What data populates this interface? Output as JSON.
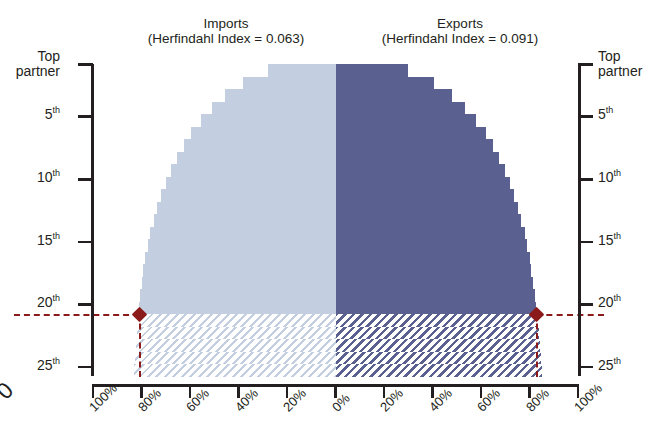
{
  "chart_data": {
    "type": "bar",
    "subtitle": "",
    "orientation": "horizontal-diverging",
    "xlabel": "",
    "ylabel": "",
    "grid": false,
    "legend_position": "top",
    "xlim": [
      -100,
      100
    ],
    "x_tick_labels": [
      "100%",
      "80%",
      "60%",
      "40%",
      "20%",
      "0%",
      "20%",
      "40%",
      "60%",
      "80%",
      "100%"
    ],
    "x_tick_values": [
      -100,
      -80,
      -60,
      -40,
      -20,
      0,
      20,
      40,
      60,
      80,
      100
    ],
    "y_tick_labels": [
      "Top partner",
      "5th",
      "10th",
      "15th",
      "20th",
      "25th"
    ],
    "y_tick_values": [
      1,
      5,
      10,
      15,
      20,
      25
    ],
    "categories": [
      "1",
      "2",
      "3",
      "4",
      "5",
      "6",
      "7",
      "8",
      "9",
      "10",
      "11",
      "12",
      "13",
      "14",
      "15",
      "16",
      "17",
      "18",
      "19",
      "20",
      "21",
      "22",
      "23",
      "24",
      "25"
    ],
    "series": [
      {
        "name": "Imports",
        "side": "left",
        "color": "#c3cfe0",
        "herfindahl_index": 0.063,
        "values": [
          28.0,
          38.0,
          45.5,
          51.0,
          55.5,
          59.5,
          62.5,
          65.5,
          68.0,
          70.0,
          72.0,
          73.5,
          75.0,
          76.5,
          77.5,
          78.5,
          79.2,
          80.0,
          80.6,
          81.0,
          81.5,
          82.0,
          82.4,
          82.8,
          83.0
        ]
      },
      {
        "name": "Exports",
        "side": "right",
        "color": "#5a6090",
        "herfindahl_index": 0.091,
        "values": [
          30.0,
          40.5,
          48.0,
          53.5,
          58.0,
          62.0,
          65.0,
          67.5,
          70.0,
          72.0,
          73.8,
          75.3,
          76.7,
          78.0,
          79.0,
          80.0,
          80.8,
          81.5,
          82.2,
          82.8,
          83.3,
          83.8,
          84.2,
          84.6,
          85.0
        ]
      }
    ],
    "hatched_from_rank": 21,
    "annotations": [
      {
        "name": "top-20-reference",
        "rank": 20,
        "imports_share": 81.0,
        "exports_share": 82.8,
        "style": "dashed",
        "color": "#8b1a1a",
        "marker": "diamond"
      }
    ]
  },
  "titles": {
    "imports": {
      "main": "Imports",
      "sub": "(Herfindahl Index = 0.063)"
    },
    "exports": {
      "main": "Exports",
      "sub": "(Herfindahl Index = 0.091)"
    }
  },
  "axes": {
    "left": {
      "labels": [
        {
          "line1": "Top",
          "line2": "partner",
          "ord": ""
        },
        {
          "num": "5",
          "ord": "th"
        },
        {
          "num": "10",
          "ord": "th"
        },
        {
          "num": "15",
          "ord": "th"
        },
        {
          "num": "20",
          "ord": "th"
        },
        {
          "num": "25",
          "ord": "th"
        }
      ]
    },
    "right": {
      "labels": [
        {
          "line1": "Top",
          "line2": "partner",
          "ord": ""
        },
        {
          "num": "5",
          "ord": "th"
        },
        {
          "num": "10",
          "ord": "th"
        },
        {
          "num": "15",
          "ord": "th"
        },
        {
          "num": "20",
          "ord": "th"
        },
        {
          "num": "25",
          "ord": "th"
        }
      ]
    },
    "bottom": {
      "labels": [
        "100%",
        "80%",
        "60%",
        "40%",
        "20%",
        "0%",
        "20%",
        "40%",
        "60%",
        "80%",
        "100%"
      ]
    }
  },
  "colors": {
    "imports_fill": "#c3cfe0",
    "exports_fill": "#5a6090",
    "reference": "#8b1a1a",
    "axis": "#231f20",
    "background": "#ffffff"
  },
  "neighbor": {
    "clipped_label": "0"
  }
}
